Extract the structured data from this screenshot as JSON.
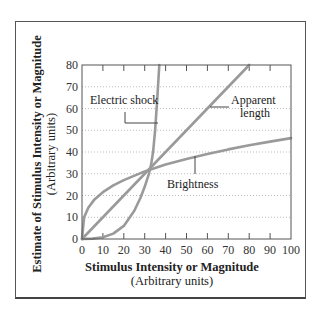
{
  "chart_data": {
    "type": "line",
    "title": "",
    "xlabel": "Stimulus Intensity or Magnitude",
    "xlabel_sub": "(Arbitrary units)",
    "ylabel": "Estimate of Stimulus Intensity or Magnitude",
    "ylabel_sub": "(Arbitrary units)",
    "xlim": [
      0,
      100
    ],
    "ylim": [
      0,
      80
    ],
    "x_ticks": [
      0,
      10,
      20,
      30,
      40,
      50,
      60,
      70,
      80,
      90,
      100
    ],
    "y_ticks": [
      0,
      10,
      20,
      30,
      40,
      50,
      60,
      70,
      80
    ],
    "grid": "horizontal dotted",
    "series": [
      {
        "name": "Electric shock",
        "x": [
          0,
          5,
          10,
          15,
          20,
          25,
          28,
          30,
          32,
          33,
          34,
          35,
          36,
          37
        ],
        "y": [
          0,
          0.2,
          0.8,
          2.5,
          6,
          13,
          19,
          24,
          30,
          34,
          40,
          50,
          64,
          80
        ]
      },
      {
        "name": "Apparent length",
        "x": [
          0,
          80
        ],
        "y": [
          0,
          80
        ]
      },
      {
        "name": "Brightness",
        "x": [
          0,
          1,
          3,
          6,
          10,
          15,
          20,
          30,
          40,
          50,
          60,
          70,
          80,
          90,
          100
        ],
        "y": [
          0,
          10,
          14.4,
          18.2,
          21.5,
          24.7,
          27.1,
          31.1,
          34.2,
          36.8,
          39.1,
          41.2,
          43.1,
          44.8,
          46.4
        ]
      }
    ],
    "annotations": [
      {
        "text": "Electric shock",
        "points_to": "Electric shock"
      },
      {
        "text": "Apparent length",
        "points_to": "Apparent length"
      },
      {
        "text": "Brightness",
        "points_to": "Brightness"
      }
    ]
  },
  "labels": {
    "electric_shock": "Electric shock",
    "apparent": "Apparent",
    "length": "length",
    "brightness": "Brightness",
    "xlabel": "Stimulus Intensity or Magnitude",
    "xlabel_sub": "(Arbitrary units)",
    "ylabel": "Estimate of Stimulus Intensity or Magnitude",
    "ylabel_sub": "(Arbitrary units)"
  },
  "colors": {
    "curve": "#9a9a9a",
    "axis": "#555555",
    "grid": "#aaaaaa"
  }
}
